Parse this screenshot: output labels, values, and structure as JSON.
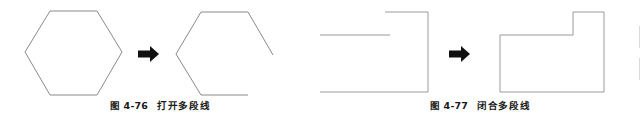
{
  "page": {
    "width": 640,
    "height": 119,
    "background": "#ffffff",
    "line_color": "#8a8a8a",
    "arrow_color": "#111111",
    "caption_color": "#1a1a1a"
  },
  "figures": [
    {
      "id": "fig-4-76",
      "caption_number": "图 4-76",
      "caption_text": "打开多段线",
      "caption_full": "图 4-76　打开多段线",
      "before": {
        "name": "closed-hexagon",
        "state": "closed",
        "points": "25,52 50,11 97,11 122,52 97,95 50,95 25,52"
      },
      "arrow": {
        "name": "transform-arrow",
        "direction": "right",
        "x": 138,
        "y": 46,
        "width": 21,
        "height": 16
      },
      "after": {
        "name": "open-hexagon",
        "state": "open",
        "points": "273,55 248,12 201,12 176,54 201,95 248,95"
      }
    },
    {
      "id": "fig-4-77",
      "caption_number": "图 4-77",
      "caption_text": "闭合多段线",
      "caption_full": "图 4-77　闭合多段线",
      "before": {
        "name": "open-polyline",
        "state": "open",
        "points": "390,35 317,35 317,92 428,92 428,12 385,12"
      },
      "arrow": {
        "name": "transform-arrow",
        "direction": "right",
        "x": 449,
        "y": 46,
        "width": 21,
        "height": 16
      },
      "after": {
        "name": "closed-polyline",
        "state": "closed",
        "points": "573,35 500,35 500,92 604,92 604,12 573,12 573,35"
      }
    }
  ],
  "arrow_glyph": "➡"
}
